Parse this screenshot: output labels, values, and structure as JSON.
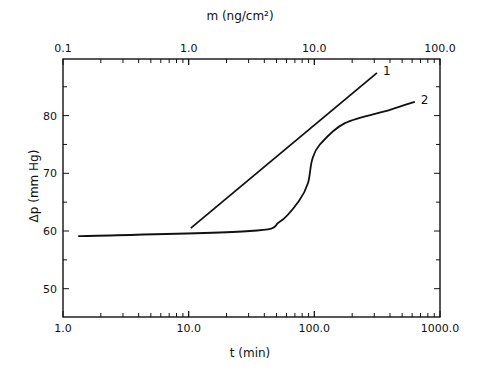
{
  "chart_data": {
    "type": "line",
    "title": "",
    "xlabel": "t (min)",
    "ylabel": "Δp (mm Hg)",
    "x2label": "m (ng/cm²)",
    "xscale": "log",
    "x2scale": "log",
    "xlim": [
      1.0,
      1000.0
    ],
    "x2lim": [
      0.1,
      100.0
    ],
    "ylim": [
      45,
      90
    ],
    "x_ticks": [
      "1.0",
      "10.0",
      "100.0",
      "1000.0"
    ],
    "x2_ticks": [
      "0.1",
      "1.0",
      "10.0",
      "100.0"
    ],
    "y_ticks": [
      "50",
      "60",
      "70",
      "80"
    ],
    "grid": false,
    "series": [
      {
        "name": "1",
        "x": [
          10.4,
          315
        ],
        "y": [
          60.5,
          87.4
        ]
      },
      {
        "name": "2",
        "x": [
          1.32,
          30.6,
          53,
          76.5,
          89,
          96,
          110,
          175,
          400,
          630
        ],
        "y": [
          59.1,
          60.0,
          61.6,
          65.4,
          68.3,
          72.3,
          74.9,
          78.7,
          81.0,
          82.4
        ]
      }
    ]
  }
}
